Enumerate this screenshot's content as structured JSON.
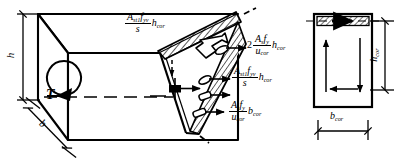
{
  "figure": {
    "line_color": "#000000",
    "background_color": "#ffffff",
    "hatch_color": "#000000"
  },
  "left_view": {
    "name": "three-dimensional beam with skew failure surface",
    "dimensions": {
      "height_label": "h",
      "width_label": "b"
    },
    "torsion": {
      "symbol": "T",
      "description": "circular torsion moment arrow"
    }
  },
  "force_labels": [
    {
      "id": "top-stirrup-force",
      "prefix": "",
      "numerator": "A",
      "numerator_sub": "st1",
      "numerator_2": "f",
      "numerator_2_sub": "yv",
      "denominator": "s",
      "multiplier": "h",
      "multiplier_sub": "cor",
      "text": "A_st1 f_yv / s · h_cor"
    },
    {
      "id": "top-longitudinal-force",
      "prefix": "2",
      "numerator": "A",
      "numerator_sub": "s",
      "numerator_2": "f",
      "numerator_2_sub": "y",
      "denominator": "u",
      "denominator_sub": "cor",
      "multiplier": "h",
      "multiplier_sub": "cor",
      "text": "2 A_s f_y / u_cor · h_cor"
    },
    {
      "id": "side-stirrup-force",
      "prefix": "",
      "numerator": "A",
      "numerator_sub": "st1",
      "numerator_2": "f",
      "numerator_2_sub": "yv",
      "denominator": "s",
      "multiplier": "h",
      "multiplier_sub": "cor",
      "text": "A_st1 f_yv / s · h_cor"
    },
    {
      "id": "bottom-longitudinal-force",
      "prefix": "",
      "numerator": "A",
      "numerator_sub": "s",
      "numerator_2": "f",
      "numerator_2_sub": "y",
      "denominator": "u",
      "denominator_sub": "cor",
      "multiplier": "b",
      "multiplier_sub": "cor",
      "text": "A_s f_y / u_cor · b_cor"
    }
  ],
  "right_view": {
    "name": "core cross-section shear flow",
    "height_label": "h",
    "height_label_sub": "cor",
    "width_label": "b",
    "width_label_sub": "cor",
    "flow": "closed circulating shear flow around the core",
    "hatched_band": "compression zone hatched band with flow arrow"
  }
}
